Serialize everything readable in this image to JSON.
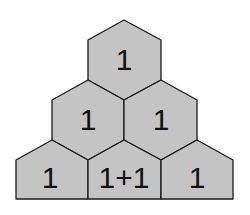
{
  "diagram": {
    "type": "hexagon-pyramid",
    "fill_color": "#c4c4c4",
    "stroke_color": "#1a1a1a",
    "rows": [
      {
        "cells": [
          {
            "label": "1"
          }
        ]
      },
      {
        "cells": [
          {
            "label": "1"
          },
          {
            "label": "1"
          }
        ]
      },
      {
        "cells": [
          {
            "label": "1"
          },
          {
            "label": "1+1"
          },
          {
            "label": "1"
          }
        ]
      }
    ]
  }
}
